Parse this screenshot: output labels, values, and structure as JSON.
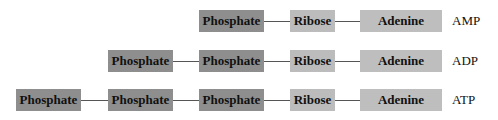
{
  "rows": [
    {
      "name": "AMP",
      "components": [
        "Phosphate",
        "Ribose",
        "Adenine"
      ],
      "label": "AMP"
    },
    {
      "name": "ADP",
      "components": [
        "Phosphate",
        "Phosphate",
        "Ribose",
        "Adenine"
      ],
      "label": "ADP"
    },
    {
      "name": "ATP",
      "components": [
        "Phosphate",
        "Phosphate",
        "Phosphate",
        "Ribose",
        "Adenine"
      ],
      "label": "ATP"
    }
  ],
  "colors": {
    "phosphate": "#8e8e8e",
    "ribose": "#bcbcbc",
    "adenine": "#bebebe",
    "connector": "#555555"
  }
}
